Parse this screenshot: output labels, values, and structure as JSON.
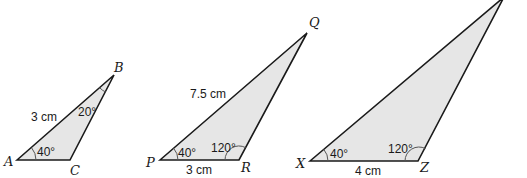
{
  "diagram": {
    "colors": {
      "fill": "#e6e6e6",
      "stroke": "#1a1a1a"
    },
    "triangles": [
      {
        "name": "ABC",
        "vertices": {
          "A": "A",
          "B": "B",
          "C": "C"
        },
        "side_label": "3 cm",
        "angle_A": "40°",
        "angle_B": "20°"
      },
      {
        "name": "PQR",
        "vertices": {
          "P": "P",
          "Q": "Q",
          "R": "R"
        },
        "side_PQ": "7.5 cm",
        "side_PR": "3 cm",
        "angle_P": "40°",
        "angle_R": "120°"
      },
      {
        "name": "XYZ",
        "vertices": {
          "X": "X",
          "Z": "Z"
        },
        "side_XZ": "4 cm",
        "angle_X": "40°",
        "angle_Z": "120°"
      }
    ]
  }
}
